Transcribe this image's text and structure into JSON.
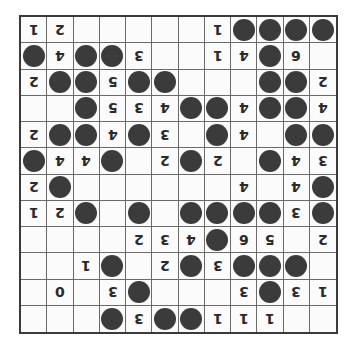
{
  "puzzle": {
    "rows": 12,
    "cols": 12,
    "orientation": "rotated-180",
    "legend": {
      "B": "black-stone",
      "": "empty",
      "digit": "clue-number"
    },
    "colors": {
      "stone": "#3b3b3b",
      "grid_line": "#6a6a6a",
      "border": "#3a3a3a",
      "text": "#2a2a2a"
    },
    "grid": [
      [
        "1",
        "2",
        "",
        "",
        "",
        "",
        "",
        "1",
        "B",
        "B",
        "B",
        "B"
      ],
      [
        "B",
        "4",
        "B",
        "B",
        "3",
        "",
        "",
        "1",
        "4",
        "B",
        "6",
        ""
      ],
      [
        "2",
        "B",
        "B",
        "5",
        "B",
        "B",
        "",
        "",
        "",
        "B",
        "B",
        "2"
      ],
      [
        "",
        "",
        "B",
        "5",
        "3",
        "4",
        "B",
        "B",
        "4",
        "B",
        "B",
        "4"
      ],
      [
        "2",
        "B",
        "B",
        "4",
        "B",
        "3",
        "",
        "B",
        "4",
        "",
        "B",
        "B"
      ],
      [
        "B",
        "4",
        "4",
        "B",
        "",
        "2",
        "B",
        "2",
        "",
        "B",
        "4",
        "3"
      ],
      [
        "2",
        "B",
        "",
        "",
        "",
        "",
        "",
        "",
        "4",
        "",
        "4",
        "B"
      ],
      [
        "1",
        "2",
        "B",
        "",
        "B",
        "",
        "B",
        "B",
        "B",
        "B",
        "3",
        "B"
      ],
      [
        "",
        "",
        "",
        "",
        "2",
        "3",
        "4",
        "B",
        "6",
        "5",
        "",
        "2"
      ],
      [
        "",
        "",
        "1",
        "B",
        "",
        "2",
        "B",
        "3",
        "B",
        "B",
        "B",
        ""
      ],
      [
        "",
        "0",
        "",
        "3",
        "B",
        "",
        "",
        "",
        "3",
        "B",
        "3",
        "1"
      ],
      [
        "",
        "",
        "",
        "B",
        "3",
        "B",
        "B",
        "1",
        "1",
        "1",
        "",
        ""
      ]
    ]
  }
}
